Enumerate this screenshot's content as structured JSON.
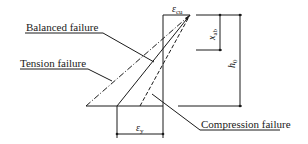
{
  "diagram": {
    "labels": {
      "balanced": "Balanced failure",
      "tension": "Tension failure",
      "compression": "Compression failure"
    },
    "symbols": {
      "ecu_main": "ε",
      "ecu_sub": "cu",
      "ey_main": "ε",
      "ey_sub": "y",
      "xab_main": "x",
      "xab_sub": "ab",
      "h0_main": "h",
      "h0_sub": "0"
    },
    "colors": {
      "line": "#1a1a1a",
      "background": "#ffffff"
    }
  }
}
